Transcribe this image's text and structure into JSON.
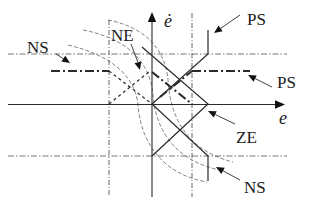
{
  "diagram": {
    "type": "phase-plane switching regions",
    "axes": {
      "x_label": "e",
      "y_label": "ė"
    },
    "labels": {
      "ps_top": "PS",
      "ps_right": "PS",
      "ns_left": "NS",
      "ne": "NE",
      "ze": "ZE",
      "ns_bottom": "NS"
    },
    "regions": [
      "NS",
      "NE",
      "ZE",
      "PS"
    ],
    "colors": {
      "line": "#2a2a2a",
      "dashed": "#666666",
      "background": "#ffffff"
    }
  }
}
